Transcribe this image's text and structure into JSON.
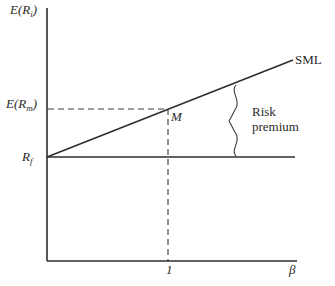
{
  "diagram": {
    "y_axis": {
      "label_main": "E(R",
      "label_sub": "i",
      "label_close": ")"
    },
    "x_axis": {
      "label": "β"
    },
    "y_ticks": {
      "market_return_main": "E(R",
      "market_return_sub": "m",
      "market_return_close": ")",
      "risk_free_main": "R",
      "risk_free_sub": "f"
    },
    "x_ticks": {
      "market_beta": "1"
    },
    "points": {
      "market_portfolio": "M"
    },
    "lines": {
      "sml_label": "SML"
    },
    "annotations": {
      "risk_premium_line1": "Risk",
      "risk_premium_line2": "premium"
    },
    "geometry": {
      "origin": [
        47,
        261
      ],
      "y_axis_top": [
        47,
        8
      ],
      "x_axis_end": [
        297,
        261
      ],
      "rf_intercept": [
        47,
        157
      ],
      "market_point": [
        168,
        109
      ],
      "sml_end": [
        293,
        60
      ],
      "rf_line_end": [
        295,
        157
      ],
      "brace_x": 237
    },
    "colors": {
      "line": "#2e2e2e",
      "text": "#2a2a2a",
      "background": "#ffffff"
    }
  }
}
